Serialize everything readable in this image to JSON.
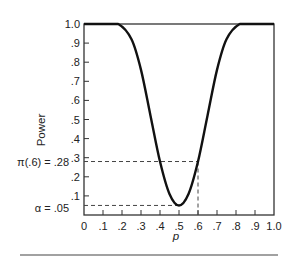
{
  "chart_data": {
    "type": "line",
    "title": "",
    "xlabel": "p",
    "ylabel": "Power",
    "xlim": [
      0,
      1.0
    ],
    "ylim": [
      0,
      1.0
    ],
    "grid": false,
    "legend": null,
    "x_ticks": [
      "0",
      ".1",
      ".2",
      ".3",
      ".4",
      ".5",
      ".6",
      ".7",
      ".8",
      ".9",
      "1.0"
    ],
    "y_ticks": [
      ".1",
      ".2",
      ".3",
      ".4",
      ".5",
      ".6",
      ".7",
      ".8",
      ".9",
      "1.0"
    ],
    "series": [
      {
        "name": "power curve",
        "x": [
          0.0,
          0.1,
          0.18,
          0.25,
          0.3,
          0.35,
          0.4,
          0.45,
          0.5,
          0.55,
          0.6,
          0.65,
          0.7,
          0.75,
          0.82,
          0.9,
          1.0
        ],
        "y": [
          1.0,
          1.0,
          1.0,
          0.92,
          0.76,
          0.52,
          0.28,
          0.11,
          0.05,
          0.11,
          0.28,
          0.52,
          0.76,
          0.92,
          1.0,
          1.0,
          1.0
        ]
      }
    ],
    "annotations": [
      {
        "label": "π(.6) = .28",
        "y": 0.28,
        "x": 0.6,
        "style": "dashed reference lines"
      },
      {
        "label": "α = .05",
        "y": 0.05,
        "x": 0.5,
        "style": "dashed reference line"
      }
    ]
  },
  "labels": {
    "xlabel": "p",
    "ylabel": "Power",
    "pi_label": "π(.6) = .28",
    "alpha_label": "α = .05"
  }
}
